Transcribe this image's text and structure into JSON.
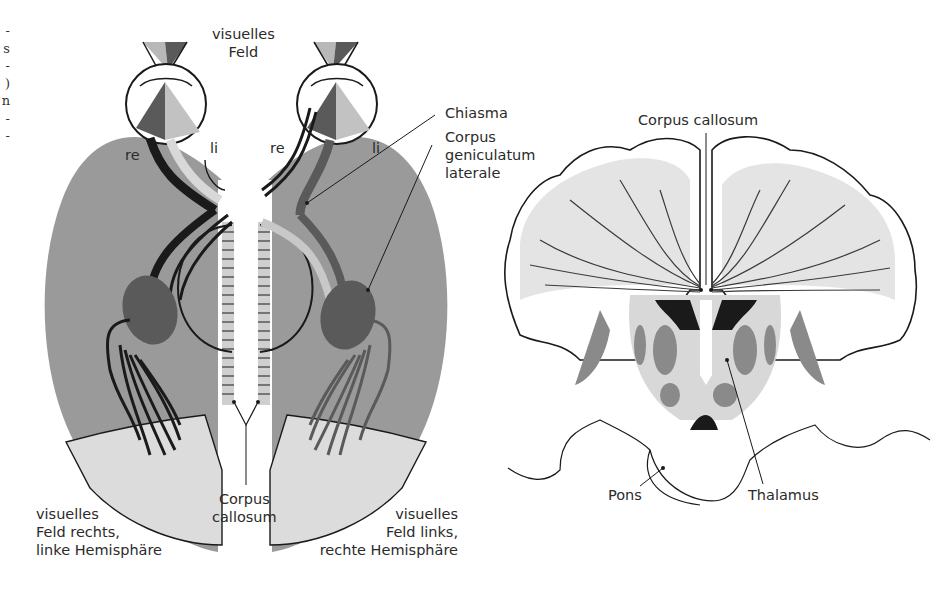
{
  "left_column_fragments": [
    "-",
    "s",
    "-",
    ")",
    "n",
    "-",
    "-"
  ],
  "diagram_left": {
    "title": "visual pathway schematic",
    "top_label": [
      "visuelles",
      "Feld"
    ],
    "eye_labels": {
      "left_eye_re": "re",
      "left_eye_li": "li",
      "right_eye_re": "re",
      "right_eye_li": "li"
    },
    "callouts": {
      "chiasma": "Chiasma",
      "cgl": [
        "Corpus",
        "geniculatum",
        "laterale"
      ],
      "corpus_callosum": [
        "Corpus",
        "callosum"
      ]
    },
    "bottom_left_label": [
      "visuelles",
      "Feld rechts,",
      "linke Hemisphäre"
    ],
    "bottom_right_label": [
      "visuelles",
      "Feld links,",
      "rechte Hemisphäre"
    ]
  },
  "diagram_right": {
    "title": "coronal brain section",
    "corpus_callosum": "Corpus callosum",
    "pons": "Pons",
    "thalamus": "Thalamus"
  },
  "colors": {
    "hemisphere_gray": "#9a9a9a",
    "visual_cortex_light": "#dcdcdc",
    "dark_gray": "#555555",
    "mid_gray": "#8a8a8a",
    "light_gray": "#c8c8c8",
    "ink": "#1a1a1a"
  }
}
